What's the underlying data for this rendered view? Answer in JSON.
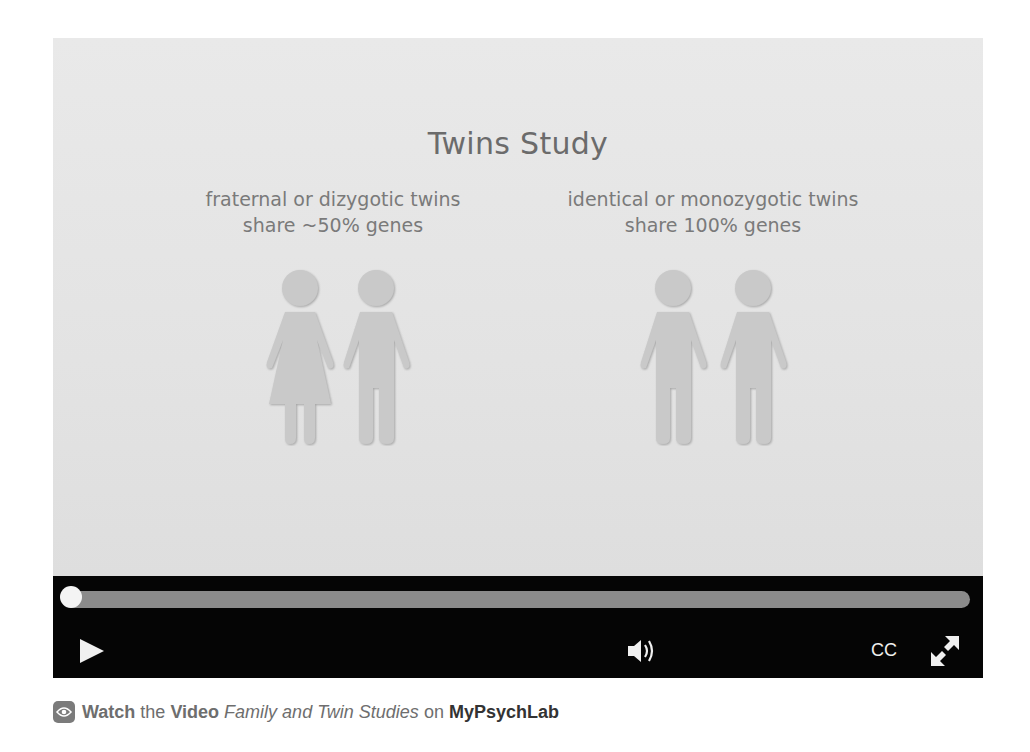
{
  "slide": {
    "title": "Twins Study",
    "left_caption": {
      "line1": "fraternal or dizygotic twins",
      "line2": "share ~50% genes",
      "figures": [
        "female-figure",
        "male-figure"
      ]
    },
    "right_caption": {
      "line1": "identical or monozygotic twins",
      "line2": "share 100% genes",
      "figures": [
        "male-figure",
        "male-figure"
      ]
    }
  },
  "player": {
    "progress_percent": 0,
    "play_icon": "play-icon",
    "volume_icon": "volume-icon",
    "cc_label": "CC",
    "fullscreen_icon": "fullscreen-icon",
    "colors": {
      "bar": "#050505",
      "track": "#8b8b8b",
      "knob": "#f4f4f4",
      "slide_bg": "#e6e6e6",
      "slide_text": "#6b6b6b"
    }
  },
  "footer": {
    "icon": "eye-icon",
    "watch": "Watch",
    "the": "the",
    "video": "Video",
    "video_title": "Family and Twin Studies",
    "on": "on",
    "brand": "MyPsychLab"
  }
}
